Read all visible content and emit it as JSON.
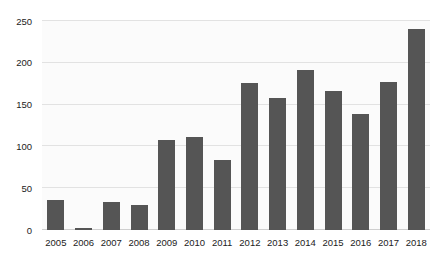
{
  "chart_data": {
    "type": "bar",
    "title": "",
    "subtitle": "",
    "xlabel": "",
    "ylabel": "",
    "categories": [
      "2005",
      "2006",
      "2007",
      "2008",
      "2009",
      "2010",
      "2011",
      "2012",
      "2013",
      "2014",
      "2015",
      "2016",
      "2017",
      "2018"
    ],
    "values": [
      36,
      2,
      34,
      30,
      108,
      111,
      84,
      176,
      158,
      192,
      166,
      139,
      177,
      240
    ],
    "series": [
      {
        "name": "",
        "values": [
          36,
          2,
          34,
          30,
          108,
          111,
          84,
          176,
          158,
          192,
          166,
          139,
          177,
          240
        ]
      }
    ],
    "ylim": [
      0,
      250
    ],
    "y_ticks": [
      0,
      50,
      100,
      150,
      200,
      250
    ],
    "y_tick_labels": [
      "0",
      "50",
      "100",
      "150",
      "200",
      "250"
    ],
    "grid": true,
    "grid_axis": "y",
    "legend": false,
    "legend_position": "none",
    "bar_color": "#555555",
    "grid_color": "#e2e2e2",
    "plot_background": "#fbfbfb",
    "background": "#ffffff",
    "axis_text_color": "#222222"
  }
}
